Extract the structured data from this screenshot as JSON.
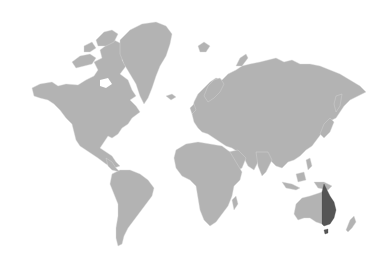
{
  "map": {
    "type": "choropleth-world-map",
    "projection": "mercator",
    "colors": {
      "background": "#ffffff",
      "land": "#b3b3b3",
      "border": "#d8d8d8",
      "highlight": "#555555"
    },
    "highlighted_region": {
      "label": "Eastern Australia",
      "country": "Australia",
      "states": [
        "Queensland",
        "New South Wales",
        "Victoria",
        "Tasmania"
      ]
    },
    "regions": [
      {
        "name": "North America"
      },
      {
        "name": "Greenland"
      },
      {
        "name": "South America"
      },
      {
        "name": "Europe"
      },
      {
        "name": "Asia"
      },
      {
        "name": "Africa"
      },
      {
        "name": "Australia"
      },
      {
        "name": "New Zealand"
      }
    ]
  }
}
